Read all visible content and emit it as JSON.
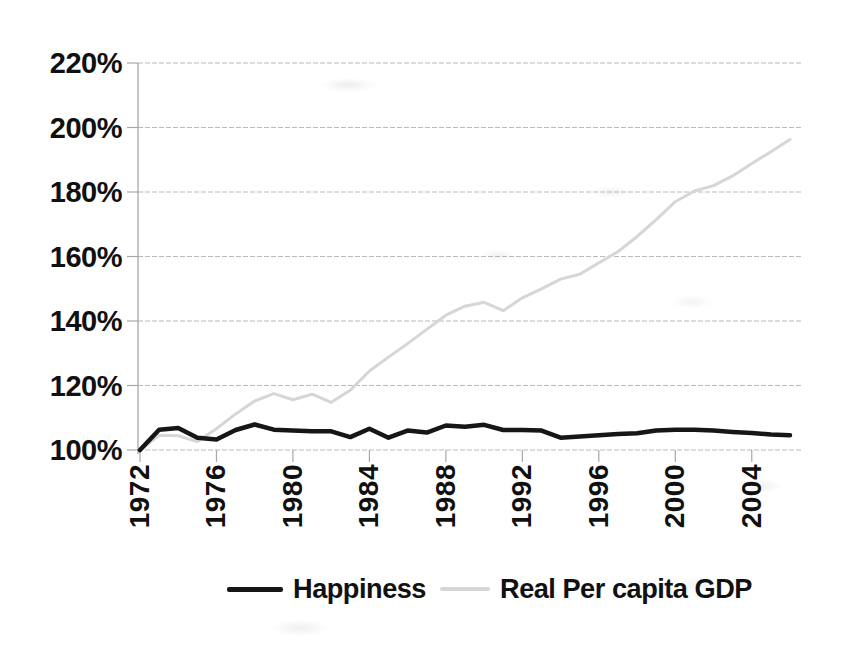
{
  "chart_data": {
    "type": "line",
    "x": [
      1972,
      1973,
      1974,
      1975,
      1976,
      1977,
      1978,
      1979,
      1980,
      1981,
      1982,
      1983,
      1984,
      1985,
      1986,
      1987,
      1988,
      1989,
      1990,
      1991,
      1992,
      1993,
      1994,
      1995,
      1996,
      1997,
      1998,
      1999,
      2000,
      2001,
      2002,
      2003,
      2004,
      2005,
      2006
    ],
    "series": [
      {
        "name": "Happiness",
        "color": "#161616",
        "stroke_width": 4.5,
        "values": [
          100,
          106.3,
          106.8,
          103.8,
          103.3,
          106.2,
          107.9,
          106.3,
          106.0,
          105.8,
          105.8,
          104.0,
          106.6,
          103.8,
          106.0,
          105.4,
          107.6,
          107.2,
          107.8,
          106.2,
          106.2,
          106.0,
          103.8,
          104.2,
          104.6,
          105.0,
          105.2,
          106.0,
          106.3,
          106.3,
          106.0,
          105.6,
          105.3,
          104.8,
          104.6
        ]
      },
      {
        "name": "Real Per capita GDP",
        "color": "#d6d6d6",
        "stroke_width": 3,
        "values": [
          100,
          104.6,
          104.4,
          102.6,
          106.6,
          111.2,
          115.2,
          117.5,
          115.6,
          117.3,
          114.8,
          118.5,
          124.5,
          128.8,
          133.0,
          137.4,
          141.8,
          144.6,
          145.8,
          143.2,
          147.2,
          150.0,
          153.0,
          154.5,
          158.0,
          161.5,
          166.2,
          171.4,
          177.0,
          180.3,
          182.0,
          185.0,
          188.8,
          192.5,
          196.3
        ]
      }
    ],
    "title": "",
    "xlabel": "",
    "ylabel": "",
    "xlim": [
      1972,
      2006
    ],
    "ylim": [
      100,
      220
    ],
    "y_ticks": [
      100,
      120,
      140,
      160,
      180,
      200,
      220
    ],
    "y_tick_labels": [
      "100%",
      "120%",
      "140%",
      "160%",
      "180%",
      "200%",
      "220%"
    ],
    "x_ticks": [
      1972,
      1976,
      1980,
      1984,
      1988,
      1992,
      1996,
      2000,
      2004
    ],
    "x_tick_labels": [
      "1972",
      "1976",
      "1980",
      "1984",
      "1988",
      "1992",
      "1996",
      "2000",
      "2004"
    ],
    "grid": true,
    "gridline_color": "#b3b3b3",
    "axis_color": "#a8a8a8",
    "legend_position": "bottom"
  },
  "legend": {
    "items": [
      {
        "label": "Happiness",
        "color": "#161616"
      },
      {
        "label": "Real Per capita GDP",
        "color": "#d6d6d6"
      }
    ]
  }
}
